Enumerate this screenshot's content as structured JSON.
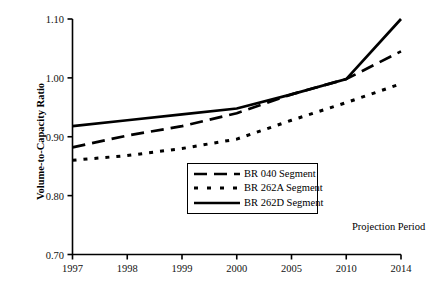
{
  "chart_data": {
    "type": "line",
    "title": "",
    "xlabel": "",
    "ylabel": "Volume-to-Capacity Ratio",
    "categories": [
      "1997",
      "1998",
      "1999",
      "2000",
      "2005",
      "2010",
      "2014"
    ],
    "ylim": [
      0.7,
      1.1
    ],
    "ytick_labels": [
      "1.10",
      "1.00",
      "0.90",
      "0.80",
      "0.70"
    ],
    "ytick_values": [
      1.1,
      1.0,
      0.9,
      0.8,
      0.7
    ],
    "grid": false,
    "legend_position": "center",
    "annotations": [
      {
        "text": "Projection Period",
        "x": "2010-2014",
        "y": 0.745
      }
    ],
    "series": [
      {
        "name": "BR 040 Segment",
        "style": "long-dash",
        "values": [
          0.882,
          0.902,
          0.918,
          0.94,
          0.972,
          0.998,
          1.045
        ]
      },
      {
        "name": "BR 262A Segment",
        "style": "dotted",
        "values": [
          0.86,
          0.868,
          0.88,
          0.896,
          0.928,
          0.958,
          0.99
        ]
      },
      {
        "name": "BR 262D Segment",
        "style": "solid",
        "values": [
          0.918,
          0.928,
          0.938,
          0.948,
          0.972,
          0.998,
          1.1
        ]
      }
    ]
  },
  "legend": {
    "items": [
      {
        "label": "BR 040 Segment",
        "style": "long-dash"
      },
      {
        "label": "BR 262A Segment",
        "style": "dotted"
      },
      {
        "label": "BR 262D Segment",
        "style": "solid"
      }
    ]
  },
  "colors": {
    "line": "#000000",
    "axis": "#000000",
    "background": "#ffffff"
  }
}
